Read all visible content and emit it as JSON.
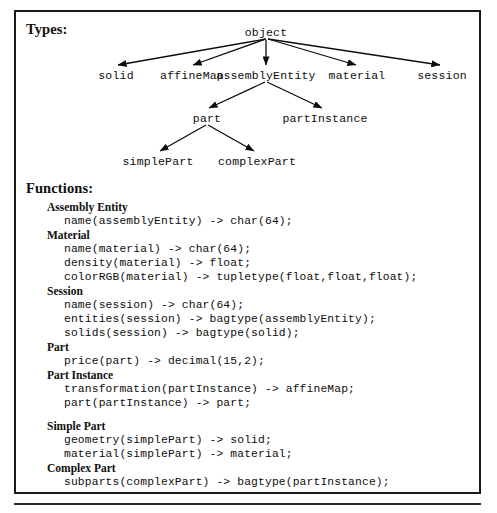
{
  "figure": {
    "types_label": "Types:",
    "functions_label": "Functions:"
  },
  "type_hierarchy": {
    "root": "object",
    "nodes": [
      {
        "id": "object",
        "label": "object"
      },
      {
        "id": "solid",
        "label": "solid"
      },
      {
        "id": "affineMap",
        "label": "affineMap"
      },
      {
        "id": "assemblyEntity",
        "label": "assemblyEntity"
      },
      {
        "id": "material",
        "label": "material"
      },
      {
        "id": "session",
        "label": "session"
      },
      {
        "id": "part",
        "label": "part"
      },
      {
        "id": "partInstance",
        "label": "partInstance"
      },
      {
        "id": "simplePart",
        "label": "simplePart"
      },
      {
        "id": "complexPart",
        "label": "complexPart"
      }
    ],
    "edges": [
      {
        "from": "object",
        "to": "solid"
      },
      {
        "from": "object",
        "to": "affineMap"
      },
      {
        "from": "object",
        "to": "assemblyEntity"
      },
      {
        "from": "object",
        "to": "material"
      },
      {
        "from": "object",
        "to": "session"
      },
      {
        "from": "assemblyEntity",
        "to": "part"
      },
      {
        "from": "assemblyEntity",
        "to": "partInstance"
      },
      {
        "from": "part",
        "to": "simplePart"
      },
      {
        "from": "part",
        "to": "complexPart"
      }
    ]
  },
  "functions": [
    {
      "group": "Assembly Entity",
      "signatures": [
        "name(assemblyEntity) -> char(64);"
      ]
    },
    {
      "group": "Material",
      "signatures": [
        "name(material) -> char(64);",
        "density(material) -> float;",
        "colorRGB(material) -> tupletype(float,float,float);"
      ]
    },
    {
      "group": "Session",
      "signatures": [
        "name(session) -> char(64);",
        "entities(session) -> bagtype(assemblyEntity);",
        "solids(session) -> bagtype(solid);"
      ]
    },
    {
      "group": "Part",
      "signatures": [
        "price(part) -> decimal(15,2);"
      ]
    },
    {
      "group": "Part Instance",
      "signatures": [
        "transformation(partInstance) -> affineMap;",
        "part(partInstance) -> part;"
      ]
    },
    {
      "group": "Simple Part",
      "spaced": true,
      "signatures": [
        "geometry(simplePart) -> solid;",
        "material(simplePart) -> material;"
      ]
    },
    {
      "group": "Complex Part",
      "signatures": [
        "subparts(complexPart) -> bagtype(partInstance);"
      ]
    }
  ],
  "colors": {
    "ink": "#0d0d0d",
    "frame": "#1a1a1a",
    "background": "#ffffff"
  }
}
